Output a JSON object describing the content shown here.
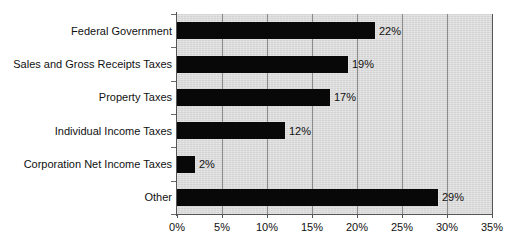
{
  "chart_data": {
    "type": "bar",
    "orientation": "horizontal",
    "title": "",
    "xlabel": "",
    "ylabel": "",
    "categories": [
      "Federal Government",
      "Sales and Gross Receipts Taxes",
      "Property Taxes",
      "Individual Income Taxes",
      "Corporation Net Income Taxes",
      "Other"
    ],
    "values": [
      22,
      19,
      17,
      12,
      2,
      29
    ],
    "value_labels": [
      "22%",
      "19%",
      "17%",
      "12%",
      "2%",
      "29%"
    ],
    "xlim": [
      0,
      35
    ],
    "xticks": [
      0,
      5,
      10,
      15,
      20,
      25,
      30,
      35
    ],
    "xtick_labels": [
      "0%",
      "5%",
      "10%",
      "15%",
      "20%",
      "25%",
      "30%",
      "35%"
    ],
    "grid": "vertical",
    "legend": "none",
    "bar_color": "#080808",
    "plot_background": "#d9d9d9",
    "gridline_color": "#8c8c8c",
    "axis_color": "#555555"
  }
}
